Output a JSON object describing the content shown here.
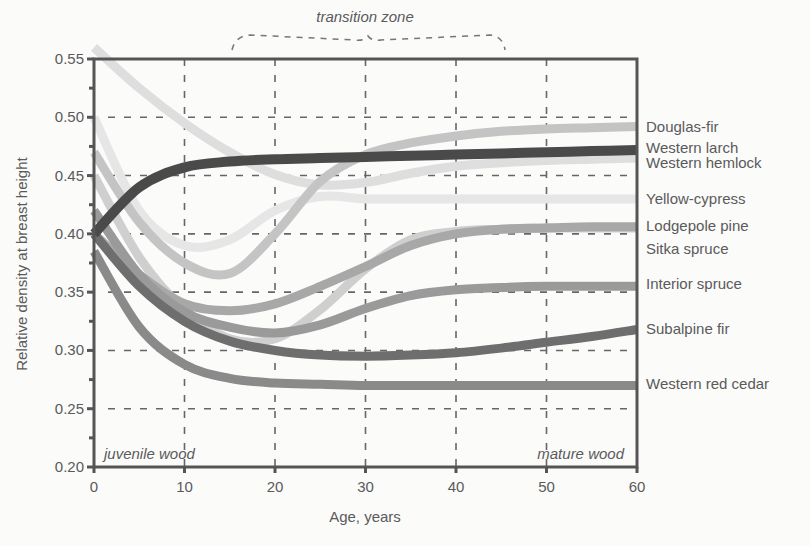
{
  "chart_data": {
    "type": "line",
    "title": "",
    "xlabel": "Age, years",
    "ylabel": "Relative density at breast height",
    "xlim": [
      0,
      60
    ],
    "ylim": [
      0.2,
      0.55
    ],
    "x_ticks": [
      "0",
      "10",
      "20",
      "30",
      "40",
      "50",
      "60"
    ],
    "y_ticks": [
      "0.20",
      "0.25",
      "0.30",
      "0.35",
      "0.40",
      "0.45",
      "0.50",
      "0.55"
    ],
    "grid": "dashed",
    "legend_position": "right (direct labels at line ends)",
    "annotations": {
      "transition_zone": "transition zone",
      "juvenile": "juvenile wood",
      "mature": "mature wood"
    },
    "x": [
      0,
      5,
      10,
      15,
      20,
      25,
      30,
      35,
      40,
      45,
      50,
      55,
      60
    ],
    "series": [
      {
        "name": "Douglas-fir",
        "color": "#c4c4c4",
        "width": 9,
        "values": [
          0.47,
          0.41,
          0.375,
          0.366,
          0.4,
          0.445,
          0.468,
          0.478,
          0.484,
          0.488,
          0.49,
          0.491,
          0.492
        ]
      },
      {
        "name": "Western larch",
        "color": "#4a4a4a",
        "width": 10,
        "values": [
          0.4,
          0.44,
          0.457,
          0.462,
          0.464,
          0.465,
          0.466,
          0.467,
          0.468,
          0.469,
          0.47,
          0.471,
          0.472
        ]
      },
      {
        "name": "Western hemlock",
        "color": "#dedede",
        "width": 9,
        "values": [
          0.56,
          0.525,
          0.495,
          0.47,
          0.451,
          0.442,
          0.444,
          0.452,
          0.458,
          0.461,
          0.463,
          0.464,
          0.465
        ]
      },
      {
        "name": "Yellow-cypress",
        "color": "#e6e6e6",
        "width": 9,
        "values": [
          0.5,
          0.42,
          0.39,
          0.395,
          0.42,
          0.432,
          0.43,
          0.43,
          0.43,
          0.43,
          0.43,
          0.43,
          0.43
        ]
      },
      {
        "name": "Lodgepole pine",
        "color": "#a8a8a8",
        "width": 9,
        "values": [
          0.4,
          0.365,
          0.34,
          0.334,
          0.34,
          0.355,
          0.372,
          0.39,
          0.4,
          0.404,
          0.405,
          0.406,
          0.406
        ]
      },
      {
        "name": "Sitka spruce",
        "color": "#cfcfcf",
        "width": 9,
        "values": [
          0.45,
          0.38,
          0.335,
          0.31,
          0.31,
          0.335,
          0.37,
          0.395,
          0.402,
          0.404,
          0.405,
          0.405,
          0.405
        ]
      },
      {
        "name": "Interior spruce",
        "color": "#9a9a9a",
        "width": 9,
        "values": [
          0.42,
          0.365,
          0.333,
          0.32,
          0.315,
          0.322,
          0.336,
          0.347,
          0.352,
          0.354,
          0.355,
          0.355,
          0.355
        ]
      },
      {
        "name": "Subalpine fir",
        "color": "#6e6e6e",
        "width": 9,
        "values": [
          0.4,
          0.355,
          0.325,
          0.308,
          0.3,
          0.296,
          0.295,
          0.296,
          0.298,
          0.302,
          0.307,
          0.312,
          0.318
        ]
      },
      {
        "name": "Western red cedar",
        "color": "#8a8a8a",
        "width": 9,
        "values": [
          0.385,
          0.32,
          0.288,
          0.276,
          0.272,
          0.271,
          0.27,
          0.27,
          0.27,
          0.27,
          0.27,
          0.27,
          0.27
        ]
      }
    ],
    "label_y": {
      "Douglas-fir": 0.492,
      "Western larch": 0.474,
      "Western hemlock": 0.461,
      "Yellow-cypress": 0.43,
      "Lodgepole pine": 0.407,
      "Sitka spruce": 0.387,
      "Interior spruce": 0.357,
      "Subalpine fir": 0.318,
      "Western red cedar": 0.271
    }
  }
}
